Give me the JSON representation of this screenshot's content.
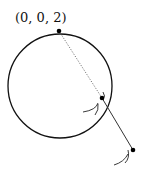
{
  "diagram": {
    "labels": {
      "north_pole": "(0, 0, 2)"
    },
    "colors": {
      "stroke": "#111111",
      "dotted": "#555555"
    }
  }
}
